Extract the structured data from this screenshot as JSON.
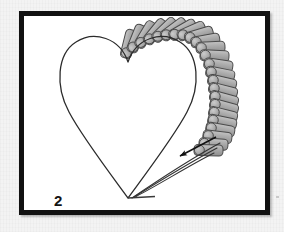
{
  "figure": {
    "domain": "instructional-craft-diagram",
    "step_label": "2",
    "title": "",
    "frame": {
      "border_color": "#111111",
      "border_width_px": 5,
      "fill_color": "#ffffff",
      "x": 19,
      "y": 11,
      "width": 251,
      "height": 204
    },
    "background_color": "#f3f3f3",
    "heart": {
      "name": "heart-outline",
      "stroke_color": "#2b2b2b",
      "stroke_width": 1.2,
      "fill": "none",
      "notch_point": [
        104,
        46
      ],
      "bottom_point": [
        104,
        182
      ],
      "left_extent_x": 34,
      "right_extent_x": 184
    },
    "beads": {
      "name": "bugle-bead-row",
      "count": 24,
      "fill_color": "#a9a9a9",
      "cap_color": "#b5b5b5",
      "stroke_color": "#4a4a4a",
      "shape": "cylinder",
      "length_px": 30,
      "width_px": 11,
      "arrangement": "radial-along-right-lobe"
    },
    "threads": {
      "name": "thread-lines",
      "count": 3,
      "stroke_color": "#333333",
      "stroke_width": 1.1,
      "from": [
        196,
        128
      ],
      "to": [
        110,
        182
      ]
    },
    "arrow": {
      "name": "direction-arrow",
      "color": "#111111",
      "tip": [
        152,
        141
      ],
      "tail": [
        192,
        121
      ],
      "direction": "down-left"
    },
    "base_line": {
      "name": "bottom-base-line",
      "color": "#3a3a3a",
      "from": [
        104,
        182
      ],
      "to": [
        131,
        181
      ]
    }
  }
}
